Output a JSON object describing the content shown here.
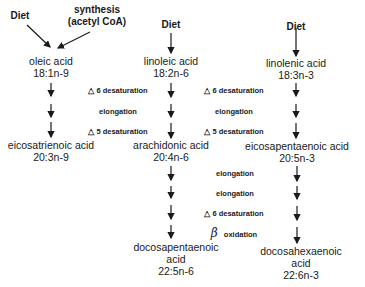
{
  "sources": {
    "left_diet": "Diet",
    "synthesis_line1": "synthesis",
    "synthesis_line2": "(acetyl CoA)",
    "middle_diet": "Diet",
    "right_diet": "Diet"
  },
  "acids": {
    "oleic": {
      "name": "oleic acid",
      "formula": "18:1n-9"
    },
    "linoleic": {
      "name": "linoleic acid",
      "formula": "18:2n-6"
    },
    "linolenic": {
      "name": "linolenic acid",
      "formula": "18:3n-3"
    },
    "eicosatrienoic": {
      "name": "eicosatrienoic acid",
      "formula": "20:3n-9"
    },
    "arachidonic": {
      "name": "arachidonic acid",
      "formula": "20:4n-6"
    },
    "eicosapentaenoic": {
      "name": "eicosapentaenoic acid",
      "formula": "20:5n-3"
    },
    "docosapentaenoic": {
      "name1": "docosapentaenoic",
      "name2": "acid",
      "formula": "22:5n-6"
    },
    "docosahexaenoic": {
      "name1": "docosahexaenoic",
      "name2": "acid",
      "formula": "22:6n-3"
    }
  },
  "steps_left": [
    {
      "symbol": "△",
      "label": "6 desaturation"
    },
    {
      "symbol": "",
      "label": "elongation"
    },
    {
      "symbol": "△",
      "label": "5 desaturation"
    }
  ],
  "steps_right_upper": [
    {
      "symbol": "△",
      "label": "6 desaturation"
    },
    {
      "symbol": "",
      "label": "elongation"
    },
    {
      "symbol": "△",
      "label": "5 desaturation"
    }
  ],
  "steps_lower": [
    {
      "symbol": "",
      "label": "elongation"
    },
    {
      "symbol": "",
      "label": "elongation"
    },
    {
      "symbol": "△",
      "label": "6 desaturation"
    },
    {
      "symbol": "β",
      "label": "oxidation"
    }
  ]
}
